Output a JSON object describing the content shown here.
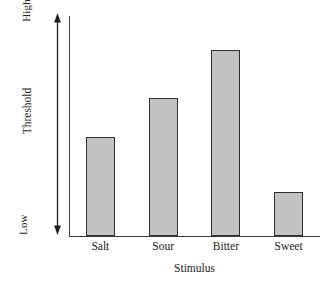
{
  "chart_data": {
    "type": "bar",
    "title": "",
    "categories": [
      "Salt",
      "Sour",
      "Bitter",
      "Sweet"
    ],
    "values": [
      0.45,
      0.63,
      0.85,
      0.2
    ],
    "xlabel": "Stimulus",
    "ylabel": "Threshold",
    "ylim": [
      0,
      1
    ],
    "y_tick_labels": [
      "Low",
      "High"
    ],
    "grid": false,
    "legend": "none",
    "bar_fill_color": "#c2c2c2",
    "bar_border_color": "#2e2e2e",
    "axis_color": "#3a3a3a",
    "y_axis_style": "double-headed-arrow"
  },
  "axes": {
    "y_title": "Threshold",
    "y_low_label": "Low",
    "y_high_label": "High",
    "x_title": "Stimulus"
  },
  "bars": [
    {
      "label": "Salt",
      "value": 0.45
    },
    {
      "label": "Sour",
      "value": 0.63
    },
    {
      "label": "Bitter",
      "value": 0.85
    },
    {
      "label": "Sweet",
      "value": 0.2
    }
  ]
}
